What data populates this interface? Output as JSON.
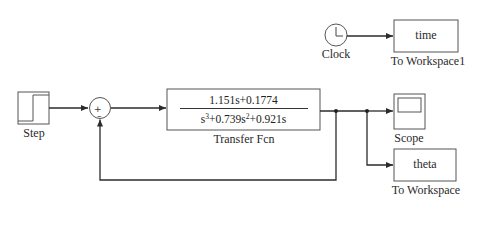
{
  "diagram": {
    "type": "simulink-block-diagram",
    "blocks": {
      "step": {
        "label": "Step"
      },
      "sum": {
        "signs": [
          "+",
          "-"
        ]
      },
      "transfer_fcn": {
        "label": "Transfer Fcn",
        "numerator": "1.151s+0.1774",
        "denominator_parts": [
          "s",
          "3",
          "+0.739s",
          "2",
          "+0.921s"
        ]
      },
      "scope": {
        "label": "Scope"
      },
      "to_workspace": {
        "label": "To Workspace",
        "variable": "theta"
      },
      "clock": {
        "label": "Clock"
      },
      "to_workspace1": {
        "label": "To Workspace1",
        "variable": "time"
      }
    },
    "connections": [
      {
        "from": "Step",
        "to": "Sum (+)"
      },
      {
        "from": "Sum",
        "to": "Transfer Fcn"
      },
      {
        "from": "Transfer Fcn",
        "to": "Scope"
      },
      {
        "from": "Transfer Fcn",
        "to": "To Workspace"
      },
      {
        "from": "Transfer Fcn",
        "to": "Sum (-)",
        "kind": "feedback"
      },
      {
        "from": "Clock",
        "to": "To Workspace1"
      }
    ],
    "colors": {
      "line": "#2b2b2b",
      "block_border": "#555555",
      "background": "#ffffff"
    }
  }
}
